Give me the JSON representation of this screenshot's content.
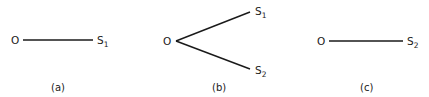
{
  "panels": [
    {
      "caption": "(a)",
      "origin": "O",
      "targets": [
        {
          "base": "S",
          "sub": "1"
        }
      ]
    },
    {
      "caption": "(b)",
      "origin": "O",
      "targets": [
        {
          "base": "S",
          "sub": "1"
        },
        {
          "base": "S",
          "sub": "2"
        }
      ]
    },
    {
      "caption": "(c)",
      "origin": "O",
      "targets": [
        {
          "base": "S",
          "sub": "2"
        }
      ]
    }
  ]
}
